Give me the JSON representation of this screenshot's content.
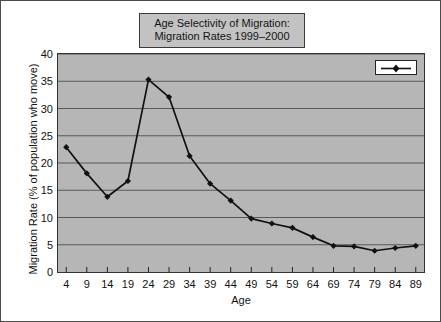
{
  "chart_data": {
    "type": "line",
    "title": "Age Selectivity of Migration: Migration Rates 1999–2000",
    "title_lines": [
      "Age Selectivity of Migration:",
      "Migration Rates 1999–2000"
    ],
    "xlabel": "Age",
    "ylabel": "Migration Rate (% of population who move)",
    "xlim": [
      2,
      91
    ],
    "ylim": [
      0,
      40
    ],
    "ytick_labels": [
      "0",
      "5",
      "10",
      "15",
      "20",
      "25",
      "30",
      "35",
      "40"
    ],
    "ytick_values": [
      0,
      5,
      10,
      15,
      20,
      25,
      30,
      35,
      40
    ],
    "xtick_labels": [
      "4",
      "9",
      "14",
      "19",
      "24",
      "29",
      "34",
      "39",
      "44",
      "49",
      "54",
      "59",
      "64",
      "69",
      "74",
      "79",
      "84",
      "89"
    ],
    "xtick_values": [
      4,
      9,
      14,
      19,
      24,
      29,
      34,
      39,
      44,
      49,
      54,
      59,
      64,
      69,
      74,
      79,
      84,
      89
    ],
    "grid": "horizontal",
    "legend_position": "top-right",
    "legend_label": "",
    "categories": [
      4,
      9,
      14,
      19,
      24,
      29,
      34,
      39,
      44,
      49,
      54,
      59,
      64,
      69,
      74,
      79,
      84,
      89
    ],
    "values": [
      22.9,
      18.1,
      13.8,
      16.7,
      35.3,
      32.1,
      21.3,
      16.2,
      13.1,
      9.8,
      8.9,
      8.1,
      6.4,
      4.8,
      4.7,
      3.9,
      4.4,
      4.8
    ],
    "series": [
      {
        "name": "Migration Rate",
        "values": [
          22.9,
          18.1,
          13.8,
          16.7,
          35.3,
          32.1,
          21.3,
          16.2,
          13.1,
          9.8,
          8.9,
          8.1,
          6.4,
          4.8,
          4.7,
          3.9,
          4.4,
          4.8
        ]
      }
    ],
    "line_color": "#111111",
    "marker_color": "#111111",
    "plot_background": "#b6b6b6",
    "title_background": "#c2c2c2"
  }
}
